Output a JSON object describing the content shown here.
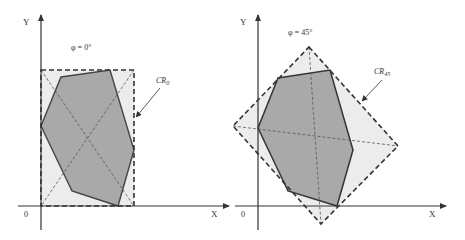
{
  "colors": {
    "background": "#ffffff",
    "axis": "#333333",
    "outer_region_fill": "#ececec",
    "polygon_fill": "#a9a9a9",
    "polygon_stroke": "#444444",
    "dash": "#444444"
  },
  "panels": [
    {
      "id": "phi-0",
      "angle_label": "φ = 0°",
      "region_label_main": "CR",
      "region_label_sub": "0",
      "y_axis_label": "Y",
      "x_axis_label": "X",
      "origin_label": "0"
    },
    {
      "id": "phi-45",
      "angle_label": "φ = 45°",
      "region_label_main": "CR",
      "region_label_sub": "45",
      "y_axis_label": "Y",
      "x_axis_label": "X",
      "origin_label": "0"
    }
  ]
}
